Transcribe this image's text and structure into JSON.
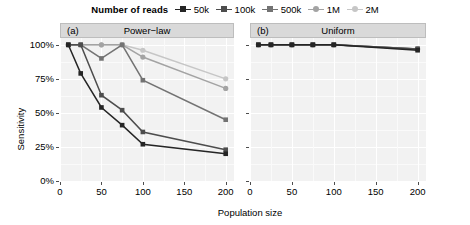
{
  "legend": {
    "title": "Number of reads",
    "items": [
      {
        "label": "50k",
        "color": "#252525"
      },
      {
        "label": "100k",
        "color": "#4d4d4d"
      },
      {
        "label": "500k",
        "color": "#737373"
      },
      {
        "label": "1M",
        "color": "#a3a3a3"
      },
      {
        "label": "2M",
        "color": "#c6c6c6"
      }
    ]
  },
  "panels": [
    {
      "tag": "(a)",
      "title": "Power−law"
    },
    {
      "tag": "(b)",
      "title": "Uniform"
    }
  ],
  "axes": {
    "y_title": "Sensitivity",
    "x_title": "Population size",
    "y_ticks": [
      "0%",
      "25%",
      "50%",
      "75%",
      "100%"
    ],
    "y_values": [
      0,
      25,
      50,
      75,
      100
    ],
    "x_ticks": [
      "0",
      "50",
      "100",
      "150",
      "200"
    ],
    "x_values": [
      0,
      50,
      100,
      150,
      200
    ]
  },
  "chart_data": {
    "type": "line",
    "title": "",
    "subtitle": "",
    "xlabel": "Population size",
    "ylabel": "Sensitivity",
    "legend_title": "Number of reads",
    "legend_position": "top-center",
    "grid": true,
    "xlim": [
      0,
      210
    ],
    "ylim": [
      0,
      105
    ],
    "y_tick_labels": [
      "0%",
      "25%",
      "50%",
      "75%",
      "100%"
    ],
    "x_tick_labels": [
      "0",
      "50",
      "100",
      "150",
      "200"
    ],
    "panels": [
      {
        "tag": "(a)",
        "name": "Power−law",
        "x": [
          10,
          25,
          50,
          75,
          100,
          200
        ],
        "series": [
          {
            "name": "50k",
            "color": "#252525",
            "values": [
              100,
              79,
              54,
              41,
              27,
              20
            ]
          },
          {
            "name": "100k",
            "color": "#4d4d4d",
            "values": [
              100,
              100,
              63,
              52,
              36,
              23
            ]
          },
          {
            "name": "500k",
            "color": "#737373",
            "values": [
              100,
              100,
              90,
              100,
              74,
              45
            ]
          },
          {
            "name": "1M",
            "color": "#a3a3a3",
            "values": [
              100,
              100,
              100,
              100,
              91,
              68
            ]
          },
          {
            "name": "2M",
            "color": "#c6c6c6",
            "values": [
              100,
              100,
              100,
              100,
              96,
              75
            ]
          }
        ]
      },
      {
        "tag": "(b)",
        "name": "Uniform",
        "x": [
          10,
          25,
          50,
          75,
          100,
          200
        ],
        "series": [
          {
            "name": "50k",
            "color": "#252525",
            "values": [
              100,
              100,
              100,
              100,
              100,
              96
            ]
          },
          {
            "name": "100k",
            "color": "#4d4d4d",
            "values": [
              100,
              100,
              100,
              100,
              100,
              97
            ]
          },
          {
            "name": "500k",
            "color": "#737373",
            "values": [
              100,
              100,
              100,
              100,
              100,
              97
            ]
          },
          {
            "name": "1M",
            "color": "#a3a3a3",
            "values": [
              100,
              100,
              100,
              100,
              100,
              97
            ]
          },
          {
            "name": "2M",
            "color": "#c6c6c6",
            "values": [
              100,
              100,
              100,
              100,
              100,
              97
            ]
          }
        ]
      }
    ]
  }
}
